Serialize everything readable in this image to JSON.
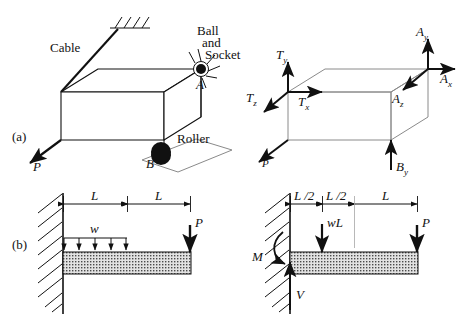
{
  "figure": {
    "panels": [
      {
        "tag": "(a)",
        "name": "three-dimensional-body"
      },
      {
        "tag": "(b)",
        "name": "cantilever-beam"
      }
    ]
  },
  "panel_a_left": {
    "tag": "(a)",
    "labels": {
      "cable": "Cable",
      "ball": "Ball",
      "and": "and",
      "socket": "Socket",
      "point_a": "A",
      "point_b": "B",
      "roller": "Roller",
      "load_p": "P"
    },
    "supports": [
      "cable",
      "ball-and-socket",
      "roller"
    ],
    "icons": [
      "hatch-ground-icon",
      "ball-socket-icon",
      "roller-icon",
      "force-arrow-icon"
    ]
  },
  "panel_a_right": {
    "reactions": {
      "tx": "T",
      "tx_sub": "x",
      "ty": "T",
      "ty_sub": "y",
      "tz": "T",
      "tz_sub": "z",
      "ax": "A",
      "ax_sub": "x",
      "ay": "A",
      "ay_sub": "y",
      "az": "A",
      "az_sub": "z",
      "by": "B",
      "by_sub": "y",
      "load_p": "P"
    },
    "icons": [
      "force-arrow-icon"
    ]
  },
  "panel_b_left": {
    "tag": "(b)",
    "dimensions": [
      "L",
      "L"
    ],
    "loads": {
      "distributed": "w",
      "point": "P"
    },
    "distributed_arrow_count": 5,
    "icons": [
      "wall-hatch-icon",
      "distributed-load-icon",
      "point-load-arrow-icon"
    ]
  },
  "panel_b_right": {
    "dimensions": [
      "L /2",
      "L /2",
      "L"
    ],
    "loads": {
      "resultant": "wL",
      "point": "P"
    },
    "reactions": {
      "moment": "M",
      "shear": "V"
    },
    "icons": [
      "wall-hatch-icon",
      "moment-arrow-icon",
      "shear-arrow-icon",
      "point-load-arrow-icon"
    ]
  },
  "colors": {
    "ink": "#111111",
    "thin_line": "#6f6f6f",
    "beam_fill": "#d9d9d9",
    "background": "#ffffff"
  }
}
